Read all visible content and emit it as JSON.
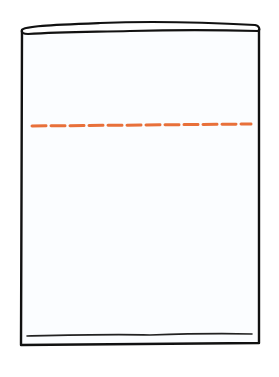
{
  "diagram": {
    "title": "",
    "colors": {
      "outline": "#111111",
      "fill_level_line": "#E8703A",
      "background": "#FFFFFF",
      "container_fill": "#FBFDFF"
    },
    "shapes": {
      "container": {
        "left": 21,
        "top": 24,
        "right": 259,
        "bottom": 345
      },
      "top_rim": {
        "y_top": 22,
        "y_bottom": 33
      },
      "bottom_line": {
        "y": 335,
        "x1": 27,
        "x2": 252
      },
      "fill_level": {
        "y": 125,
        "x1": 31,
        "x2": 251,
        "style": "dashed",
        "dash": 15,
        "gap": 5
      }
    },
    "labels": []
  }
}
